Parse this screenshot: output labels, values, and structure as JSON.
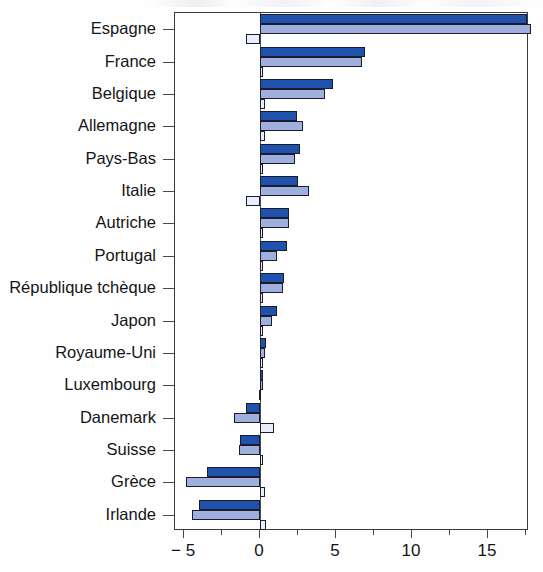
{
  "chart_data": {
    "type": "bar",
    "orientation": "horizontal",
    "title": "",
    "xlabel": "",
    "ylabel": "",
    "xlim": [
      -5.6,
      17.7
    ],
    "grid": false,
    "legend": "none",
    "xticks": [
      -5,
      0,
      5,
      10,
      15
    ],
    "xtick_labels": [
      "− 5",
      "0",
      "5",
      "10",
      "15"
    ],
    "minor_xticks": [
      -2.5,
      2.5,
      7.5,
      12.5,
      17.5
    ],
    "categories": [
      "Espagne",
      "France",
      "Belgique",
      "Allemagne",
      "Pays-Bas",
      "Italie",
      "Autriche",
      "Portugal",
      "République tchèque",
      "Japon",
      "Royaume-Uni",
      "Luxembourg",
      "Danemark",
      "Suisse",
      "Grèce",
      "Irlande"
    ],
    "series": [
      {
        "name": "series-1",
        "color": "#1f52ad",
        "values": [
          17.6,
          6.9,
          4.8,
          2.4,
          2.6,
          2.5,
          1.9,
          1.8,
          1.6,
          1.1,
          0.4,
          0.2,
          -0.9,
          -1.3,
          -3.5,
          -4.0
        ]
      },
      {
        "name": "series-2",
        "color": "#9fb0de",
        "values": [
          17.8,
          6.7,
          4.3,
          2.8,
          2.3,
          3.2,
          1.9,
          1.1,
          1.5,
          0.8,
          0.3,
          0.1,
          -1.7,
          -1.4,
          -4.9,
          -4.5
        ]
      },
      {
        "name": "series-3",
        "color": "#e9edf8",
        "values": [
          -0.9,
          0.1,
          0.3,
          0.3,
          0.2,
          -0.9,
          0.2,
          0.2,
          0.1,
          0.1,
          0.1,
          -0.1,
          0.9,
          0.0,
          0.3,
          0.4
        ]
      }
    ]
  }
}
